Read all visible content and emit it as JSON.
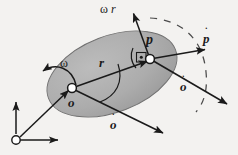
{
  "figure": {
    "type": "mechanics-kinematics-diagram",
    "background_color": "#f3f2f0",
    "body_fill_color": "#a9a9a9",
    "body_edge_color": "#6e6e6e",
    "ink_color": "#1a1a1a",
    "dash_color": "#4a4a4a"
  },
  "labels": {
    "omega_r_tilde": {
      "omega": "ω",
      "r": "r",
      "tilde": "˜"
    },
    "point_p": "p",
    "p_dot": {
      "base": "p",
      "dot": "˙"
    },
    "omega": "ω",
    "r": "r",
    "point_o": "o",
    "o_dot_right": {
      "base": "o",
      "dot": "˙"
    },
    "o_dot_bottom": {
      "base": "o",
      "dot": "˙"
    }
  },
  "geometry": {
    "ellipse": {
      "cx": 112,
      "cy": 74,
      "rx": 68,
      "ry": 38,
      "rotation_deg": -21
    },
    "point_o": {
      "x": 72,
      "y": 88
    },
    "point_p": {
      "x": 150,
      "y": 59
    },
    "frame_origin": {
      "x": 16,
      "y": 140
    },
    "marker_radius": 4.2
  },
  "vectors": [
    {
      "name": "r",
      "from": "o",
      "to": "p",
      "label": "r"
    },
    {
      "name": "omega-r-tilde",
      "from": "p",
      "label": "ω r̃",
      "direction": "up-left-of-vertical"
    },
    {
      "name": "p-dot",
      "from": "p",
      "label": "ṗ",
      "direction": "right"
    },
    {
      "name": "o-dot-upper",
      "from": "p",
      "label": "ȯ",
      "direction": "down-right"
    },
    {
      "name": "o-dot-lower",
      "from": "o",
      "label": "ȯ",
      "direction": "down-right"
    },
    {
      "name": "position-o",
      "from": "frame-origin",
      "to": "o",
      "label": ""
    },
    {
      "name": "frame-axis-vertical",
      "from": "frame-origin",
      "label": "",
      "direction": "up"
    },
    {
      "name": "frame-axis-horizontal",
      "from": "frame-origin",
      "label": "",
      "direction": "right"
    }
  ],
  "annotations": {
    "right_angle_marker": "right-angle-with-dot at point p",
    "omega_arc": "curved arrow indicating rotation sense (counter-clockwise shown leftward)",
    "r_arc": "arc spanning angle at o between r and o-dot",
    "dashed_trajectory": "dashed arc through the neighbourhood of p"
  }
}
